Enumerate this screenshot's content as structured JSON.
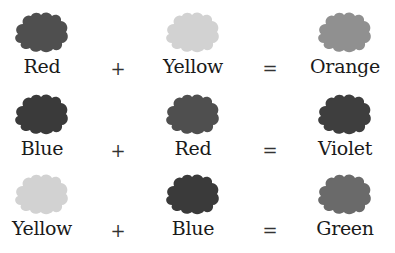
{
  "operators": {
    "plus": "+",
    "equals": "="
  },
  "rows": [
    {
      "left": {
        "label": "Red",
        "color": "#4f4f4f"
      },
      "right": {
        "label": "Yellow",
        "color": "#d2d2d2"
      },
      "result": {
        "label": "Orange",
        "color": "#909090"
      }
    },
    {
      "left": {
        "label": "Blue",
        "color": "#3a3a3a"
      },
      "right": {
        "label": "Red",
        "color": "#4f4f4f"
      },
      "result": {
        "label": "Violet",
        "color": "#3e3e3e"
      }
    },
    {
      "left": {
        "label": "Yellow",
        "color": "#d2d2d2"
      },
      "right": {
        "label": "Blue",
        "color": "#3a3a3a"
      },
      "result": {
        "label": "Green",
        "color": "#6a6a6a"
      }
    }
  ]
}
